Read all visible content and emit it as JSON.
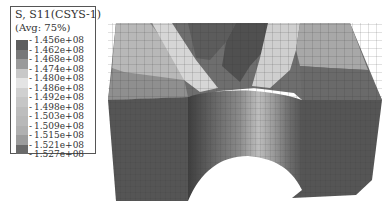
{
  "legend": {
    "title": "S, S11(CSYS-1)",
    "average": "(Avg: 75%)",
    "values": [
      "-1.456e+08",
      "-1.462e+08",
      "-1.468e+08",
      "-1.474e+08",
      "-1.480e+08",
      "-1.486e+08",
      "-1.492e+08",
      "-1.498e+08",
      "-1.503e+08",
      "-1.509e+08",
      "-1.515e+08",
      "-1.521e+08",
      "-1.527e+08"
    ],
    "colors": [
      "#5e5e5e",
      "#787878",
      "#9a9a9a",
      "#c8c8c8",
      "#e4e4e4",
      "#d0d0d0",
      "#c6c6c6",
      "#bdbdbd",
      "#b8b8b8",
      "#b0b0b0",
      "#9c9c9c",
      "#6a6a6a",
      "#5a5a5a"
    ]
  },
  "model": {
    "description": "Block with half-cylindrical cut, meshed, showing S11 stress contour"
  }
}
